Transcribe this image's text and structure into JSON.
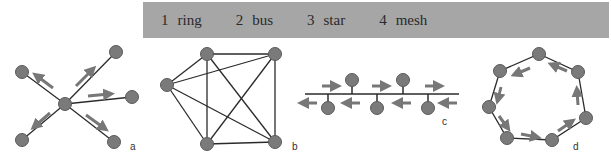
{
  "legend": {
    "items": [
      {
        "num": "1",
        "label": "ring"
      },
      {
        "num": "2",
        "label": "bus"
      },
      {
        "num": "3",
        "label": "star"
      },
      {
        "num": "4",
        "label": "mesh"
      }
    ]
  },
  "figures": [
    {
      "id": "a",
      "label": "a",
      "topology": "star"
    },
    {
      "id": "b",
      "label": "b",
      "topology": "mesh"
    },
    {
      "id": "c",
      "label": "c",
      "topology": "bus"
    },
    {
      "id": "d",
      "label": "d",
      "topology": "ring"
    }
  ],
  "colors": {
    "node": "#7a7a7a",
    "node_stroke": "#5a5a5a",
    "edge": "#2b2b2b",
    "arrow": "#777777",
    "legend_bg": "#a6a6a6"
  }
}
